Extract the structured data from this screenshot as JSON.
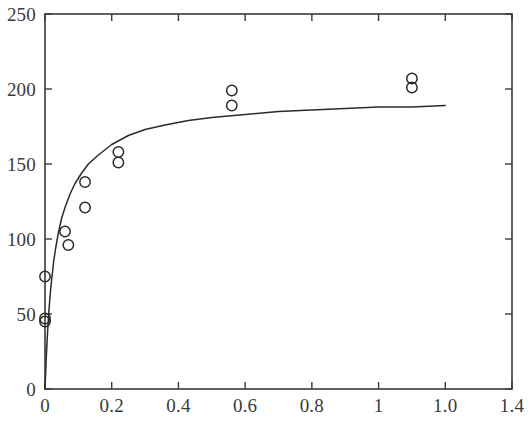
{
  "chart_data": {
    "type": "scatter",
    "title": "",
    "subtitle": "",
    "xlabel": "",
    "ylabel": "",
    "xlim": [
      0,
      1.4
    ],
    "ylim": [
      0,
      250
    ],
    "grid": false,
    "legend": null,
    "legend_position": "none",
    "xticks": [
      {
        "value": 0,
        "label": "0"
      },
      {
        "value": 0.2,
        "label": "0.2"
      },
      {
        "value": 0.4,
        "label": "0.4"
      },
      {
        "value": 0.6,
        "label": "0.6"
      },
      {
        "value": 0.8,
        "label": "0.8"
      },
      {
        "value": 1.0,
        "label": "1"
      },
      {
        "value": 1.2,
        "label": "1.0"
      },
      {
        "value": 1.4,
        "label": "1.4"
      }
    ],
    "yticks": [
      {
        "value": 0,
        "label": "0"
      },
      {
        "value": 50,
        "label": "50"
      },
      {
        "value": 100,
        "label": "100"
      },
      {
        "value": 150,
        "label": "150"
      },
      {
        "value": 200,
        "label": "200"
      },
      {
        "value": 250,
        "label": "250"
      }
    ],
    "series": [
      {
        "name": "observed-data",
        "type": "scatter",
        "marker": "open-circle",
        "color": "#2b2b2b",
        "points": [
          {
            "x": 0.0,
            "y": 45
          },
          {
            "x": 0.0,
            "y": 47
          },
          {
            "x": 0.0,
            "y": 75
          },
          {
            "x": 0.06,
            "y": 105
          },
          {
            "x": 0.07,
            "y": 96
          },
          {
            "x": 0.12,
            "y": 138
          },
          {
            "x": 0.12,
            "y": 121
          },
          {
            "x": 0.22,
            "y": 158
          },
          {
            "x": 0.22,
            "y": 151
          },
          {
            "x": 0.56,
            "y": 199
          },
          {
            "x": 0.56,
            "y": 189
          },
          {
            "x": 1.1,
            "y": 207
          },
          {
            "x": 1.1,
            "y": 201
          }
        ]
      },
      {
        "name": "fitted-curve",
        "type": "line",
        "color": "#2b2b2b",
        "points": [
          {
            "x": 0.0,
            "y": 0
          },
          {
            "x": 0.004,
            "y": 22
          },
          {
            "x": 0.008,
            "y": 39
          },
          {
            "x": 0.012,
            "y": 53
          },
          {
            "x": 0.016,
            "y": 64
          },
          {
            "x": 0.02,
            "y": 73
          },
          {
            "x": 0.026,
            "y": 85
          },
          {
            "x": 0.032,
            "y": 94
          },
          {
            "x": 0.04,
            "y": 104
          },
          {
            "x": 0.05,
            "y": 114
          },
          {
            "x": 0.06,
            "y": 121
          },
          {
            "x": 0.075,
            "y": 130
          },
          {
            "x": 0.09,
            "y": 137
          },
          {
            "x": 0.11,
            "y": 144
          },
          {
            "x": 0.13,
            "y": 150
          },
          {
            "x": 0.16,
            "y": 156
          },
          {
            "x": 0.2,
            "y": 163
          },
          {
            "x": 0.25,
            "y": 169
          },
          {
            "x": 0.3,
            "y": 173
          },
          {
            "x": 0.36,
            "y": 176
          },
          {
            "x": 0.43,
            "y": 179
          },
          {
            "x": 0.5,
            "y": 181
          },
          {
            "x": 0.6,
            "y": 183
          },
          {
            "x": 0.7,
            "y": 185
          },
          {
            "x": 0.8,
            "y": 186
          },
          {
            "x": 0.9,
            "y": 187
          },
          {
            "x": 1.0,
            "y": 188
          },
          {
            "x": 1.1,
            "y": 188
          },
          {
            "x": 1.2,
            "y": 189
          }
        ]
      }
    ],
    "axis_color": "#3a3a3a",
    "background_color": "#ffffff"
  }
}
